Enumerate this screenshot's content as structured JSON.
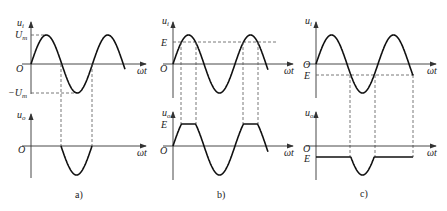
{
  "panels": [
    {
      "id": "a",
      "caption": "a)",
      "input_label": "u",
      "input_sub": "i",
      "output_label": "u",
      "output_sub": "o",
      "x_label": "ωt",
      "origin_label": "O",
      "level_labels": [
        "U",
        "−U"
      ],
      "level_subs": [
        "m",
        "m"
      ],
      "description": "Half-wave rectified: output follows only negative half of input"
    },
    {
      "id": "b",
      "caption": "b)",
      "input_label": "u",
      "input_sub": "i",
      "output_label": "u",
      "output_sub": "o",
      "x_label": "ωt",
      "origin_label": "O",
      "level_labels": [
        "E"
      ],
      "output_level_label": "E",
      "description": "Upper clipping at level E"
    },
    {
      "id": "c",
      "caption": "c)",
      "input_label": "u",
      "input_sub": "i",
      "output_label": "u",
      "output_sub": "o",
      "x_label": "ωt",
      "origin_label": "O",
      "level_labels": [
        "E"
      ],
      "output_level_label": "E",
      "description": "Output held at negative level E, follows input below E"
    }
  ]
}
